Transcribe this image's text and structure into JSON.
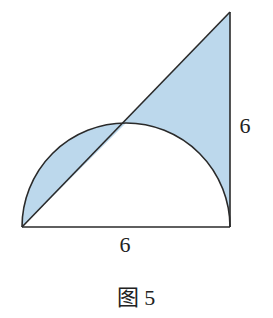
{
  "figure": {
    "caption": "图 5",
    "labels": {
      "bottom_side": "6",
      "right_side": "6"
    },
    "colors": {
      "shade": "#bcd8ec",
      "stroke": "#2a2a2a",
      "background": "#ffffff"
    },
    "geometry": {
      "bottom_left": [
        22,
        227
      ],
      "bottom_right": [
        230,
        227
      ],
      "top_right": [
        230,
        12
      ],
      "semicircle_center": [
        126,
        227
      ],
      "semicircle_radius": 104
    }
  }
}
